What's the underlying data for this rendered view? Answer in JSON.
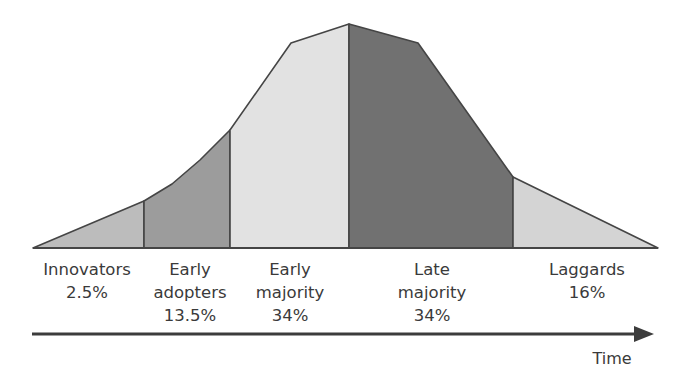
{
  "diagram": {
    "axis_label": "Time",
    "outline_color": "#454545",
    "segments": [
      {
        "name": "innovators",
        "label_lines": [
          "Innovators",
          "2.5%"
        ],
        "percent": "2.5%",
        "color": "#bcbcbc",
        "points": "33,248 144,201 144,248",
        "label_x": 87,
        "label_y": 258
      },
      {
        "name": "early-adopters",
        "label_lines": [
          "Early",
          "adopters",
          "13.5%"
        ],
        "percent": "13.5%",
        "color": "#9c9c9c",
        "points": "144,248 144,201 172,184 200,160 230,130 230,248",
        "label_x": 190,
        "label_y": 258
      },
      {
        "name": "early-majority",
        "label_lines": [
          "Early",
          "majority",
          "34%"
        ],
        "percent": "34%",
        "color": "#e2e2e2",
        "points": "230,248 230,130 291,43 349,24 349,248",
        "label_x": 290,
        "label_y": 258
      },
      {
        "name": "late-majority",
        "label_lines": [
          "Late",
          "majority",
          "34%"
        ],
        "percent": "34%",
        "color": "#717171",
        "points": "349,248 349,24 418,43 513,177 513,248",
        "label_x": 432,
        "label_y": 258
      },
      {
        "name": "laggards",
        "label_lines": [
          "Laggards",
          "16%"
        ],
        "percent": "16%",
        "color": "#d4d4d4",
        "points": "513,248 513,177 658,248",
        "label_x": 587,
        "label_y": 258
      }
    ]
  }
}
